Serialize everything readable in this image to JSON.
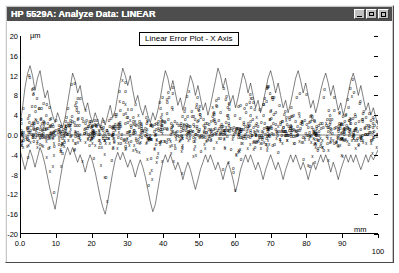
{
  "window": {
    "title": "HP 5529A: Analyze Data: LINEAR",
    "controls": [
      {
        "name": "minimize",
        "label": "_"
      },
      {
        "name": "maximize",
        "label": "□"
      },
      {
        "name": "close",
        "label": "×"
      }
    ]
  },
  "chart_data": {
    "type": "scatter",
    "title": "Linear Error Plot - X Axis",
    "xlabel": "mm",
    "ylabel": "µm",
    "xlim": [
      0,
      100
    ],
    "ylim": [
      -20,
      20
    ],
    "grid": false,
    "legend": "none",
    "xticks": [
      "0.0",
      "10",
      "20",
      "30",
      "40",
      "50",
      "60",
      "70",
      "80",
      "90",
      "100"
    ],
    "xtick_values": [
      0,
      10,
      20,
      30,
      40,
      50,
      60,
      70,
      80,
      90,
      100
    ],
    "yticks": [
      "20",
      "16",
      "12",
      "8",
      "4",
      "0.0",
      "-4",
      "-8",
      "-12",
      "-16",
      "-20"
    ],
    "ytick_values": [
      20,
      16,
      12,
      8,
      4,
      0,
      -4,
      -8,
      -12,
      -16,
      -20
    ],
    "x_unit": "mm",
    "y_unit": "µm",
    "series": [
      {
        "name": "forward-run",
        "marker": "o",
        "description": "Forward direction measurement points"
      },
      {
        "name": "reverse-run",
        "marker": "x",
        "description": "Reverse direction measurement points"
      },
      {
        "name": "upper-envelope",
        "marker": "line",
        "description": "Upper bound trace"
      },
      {
        "name": "lower-envelope",
        "marker": "line",
        "description": "Lower bound trace"
      }
    ],
    "upper_envelope": [
      [
        0.0,
        2.0
      ],
      [
        0.7,
        5.5
      ],
      [
        1.4,
        9.6
      ],
      [
        2.1,
        12.4
      ],
      [
        2.8,
        14.0
      ],
      [
        3.5,
        12.0
      ],
      [
        4.2,
        9.0
      ],
      [
        4.9,
        11.5
      ],
      [
        5.6,
        13.0
      ],
      [
        6.3,
        10.0
      ],
      [
        7.0,
        7.5
      ],
      [
        7.7,
        9.0
      ],
      [
        8.4,
        6.0
      ],
      [
        9.1,
        4.0
      ],
      [
        9.8,
        2.5
      ],
      [
        10.5,
        4.5
      ],
      [
        11.2,
        3.0
      ],
      [
        11.9,
        1.5
      ],
      [
        12.6,
        3.5
      ],
      [
        13.3,
        6.5
      ],
      [
        14.0,
        9.5
      ],
      [
        14.7,
        12.5
      ],
      [
        15.4,
        11.0
      ],
      [
        16.1,
        8.5
      ],
      [
        16.8,
        10.0
      ],
      [
        17.5,
        7.0
      ],
      [
        18.2,
        5.0
      ],
      [
        18.9,
        6.5
      ],
      [
        19.6,
        4.0
      ],
      [
        20.3,
        2.5
      ],
      [
        21.0,
        4.5
      ],
      [
        21.7,
        3.0
      ],
      [
        22.4,
        1.5
      ],
      [
        23.1,
        3.5
      ],
      [
        23.8,
        2.0
      ],
      [
        24.5,
        4.0
      ],
      [
        25.2,
        6.0
      ],
      [
        25.9,
        3.5
      ],
      [
        26.6,
        5.0
      ],
      [
        27.3,
        8.0
      ],
      [
        28.0,
        11.0
      ],
      [
        28.7,
        13.5
      ],
      [
        29.4,
        12.0
      ],
      [
        30.1,
        10.0
      ],
      [
        30.8,
        12.0
      ],
      [
        31.5,
        9.0
      ],
      [
        32.2,
        6.5
      ],
      [
        32.9,
        8.0
      ],
      [
        33.6,
        5.5
      ],
      [
        34.3,
        4.0
      ],
      [
        35.0,
        6.0
      ],
      [
        35.7,
        4.0
      ],
      [
        36.4,
        2.5
      ],
      [
        37.1,
        4.5
      ],
      [
        37.8,
        3.0
      ],
      [
        38.5,
        5.0
      ],
      [
        39.2,
        7.5
      ],
      [
        39.9,
        10.5
      ],
      [
        40.6,
        13.0
      ],
      [
        41.3,
        11.5
      ],
      [
        42.0,
        9.0
      ],
      [
        42.7,
        11.0
      ],
      [
        43.4,
        8.5
      ],
      [
        44.1,
        6.0
      ],
      [
        44.8,
        7.5
      ],
      [
        45.5,
        5.0
      ],
      [
        46.2,
        7.0
      ],
      [
        46.9,
        9.5
      ],
      [
        47.6,
        12.0
      ],
      [
        48.3,
        10.5
      ],
      [
        49.0,
        8.0
      ],
      [
        49.7,
        10.0
      ],
      [
        50.4,
        7.5
      ],
      [
        51.1,
        5.0
      ],
      [
        51.8,
        6.5
      ],
      [
        52.5,
        4.0
      ],
      [
        53.2,
        6.0
      ],
      [
        53.9,
        8.5
      ],
      [
        54.6,
        11.0
      ],
      [
        55.3,
        13.5
      ],
      [
        56.0,
        12.0
      ],
      [
        56.7,
        9.5
      ],
      [
        57.4,
        11.5
      ],
      [
        58.1,
        9.0
      ],
      [
        58.8,
        6.5
      ],
      [
        59.5,
        8.0
      ],
      [
        60.2,
        5.5
      ],
      [
        60.9,
        7.5
      ],
      [
        61.6,
        10.0
      ],
      [
        62.3,
        12.5
      ],
      [
        63.0,
        11.0
      ],
      [
        63.7,
        8.5
      ],
      [
        64.4,
        10.5
      ],
      [
        65.1,
        8.0
      ],
      [
        65.8,
        5.5
      ],
      [
        66.5,
        7.0
      ],
      [
        67.2,
        4.5
      ],
      [
        67.9,
        6.5
      ],
      [
        68.6,
        9.0
      ],
      [
        69.3,
        11.5
      ],
      [
        70.0,
        13.0
      ],
      [
        70.7,
        11.0
      ],
      [
        71.4,
        8.5
      ],
      [
        72.1,
        10.5
      ],
      [
        72.8,
        8.0
      ],
      [
        73.5,
        5.5
      ],
      [
        74.2,
        7.0
      ],
      [
        74.9,
        4.5
      ],
      [
        75.6,
        6.5
      ],
      [
        76.3,
        9.0
      ],
      [
        77.0,
        11.5
      ],
      [
        77.7,
        13.0
      ],
      [
        78.4,
        11.0
      ],
      [
        79.1,
        8.5
      ],
      [
        79.8,
        10.5
      ],
      [
        80.5,
        8.0
      ],
      [
        81.2,
        5.5
      ],
      [
        81.9,
        7.0
      ],
      [
        82.6,
        4.5
      ],
      [
        83.3,
        6.5
      ],
      [
        84.0,
        9.0
      ],
      [
        84.7,
        11.0
      ],
      [
        85.4,
        12.5
      ],
      [
        86.1,
        10.5
      ],
      [
        86.8,
        8.0
      ],
      [
        87.5,
        10.0
      ],
      [
        88.2,
        7.5
      ],
      [
        88.9,
        5.0
      ],
      [
        89.6,
        6.5
      ],
      [
        90.3,
        4.0
      ],
      [
        91.0,
        6.0
      ],
      [
        91.7,
        8.5
      ],
      [
        92.4,
        11.0
      ],
      [
        93.1,
        12.5
      ],
      [
        93.8,
        10.5
      ],
      [
        94.5,
        8.0
      ],
      [
        95.2,
        10.0
      ],
      [
        95.9,
        7.5
      ],
      [
        96.6,
        5.0
      ],
      [
        97.3,
        6.5
      ],
      [
        98.0,
        4.0
      ],
      [
        98.7,
        5.5
      ],
      [
        99.4,
        3.5
      ],
      [
        100.0,
        2.0
      ]
    ],
    "lower_envelope": [
      [
        0.0,
        -3.0
      ],
      [
        0.7,
        -5.0
      ],
      [
        1.4,
        -7.0
      ],
      [
        2.1,
        -5.0
      ],
      [
        2.8,
        -3.0
      ],
      [
        3.5,
        -4.5
      ],
      [
        4.2,
        -6.5
      ],
      [
        4.9,
        -4.5
      ],
      [
        5.6,
        -2.5
      ],
      [
        6.3,
        -4.0
      ],
      [
        7.0,
        -6.0
      ],
      [
        7.7,
        -8.5
      ],
      [
        8.4,
        -11.0
      ],
      [
        9.1,
        -13.0
      ],
      [
        9.8,
        -15.0
      ],
      [
        10.5,
        -12.0
      ],
      [
        11.2,
        -9.0
      ],
      [
        11.9,
        -6.0
      ],
      [
        12.6,
        -4.0
      ],
      [
        13.3,
        -2.5
      ],
      [
        14.0,
        -4.0
      ],
      [
        14.7,
        -2.5
      ],
      [
        15.4,
        -4.0
      ],
      [
        16.1,
        -5.5
      ],
      [
        16.8,
        -4.0
      ],
      [
        17.5,
        -5.5
      ],
      [
        18.2,
        -7.5
      ],
      [
        18.9,
        -5.5
      ],
      [
        19.6,
        -4.0
      ],
      [
        20.3,
        -5.5
      ],
      [
        21.0,
        -7.5
      ],
      [
        21.7,
        -10.0
      ],
      [
        22.4,
        -12.5
      ],
      [
        23.1,
        -14.5
      ],
      [
        23.8,
        -16.0
      ],
      [
        24.5,
        -13.5
      ],
      [
        25.2,
        -10.5
      ],
      [
        25.9,
        -7.5
      ],
      [
        26.6,
        -5.0
      ],
      [
        27.3,
        -3.5
      ],
      [
        28.0,
        -5.0
      ],
      [
        28.7,
        -3.5
      ],
      [
        29.4,
        -5.0
      ],
      [
        30.1,
        -6.5
      ],
      [
        30.8,
        -5.0
      ],
      [
        31.5,
        -6.5
      ],
      [
        32.2,
        -8.5
      ],
      [
        32.9,
        -6.5
      ],
      [
        33.6,
        -5.0
      ],
      [
        34.3,
        -6.5
      ],
      [
        35.0,
        -8.5
      ],
      [
        35.7,
        -11.0
      ],
      [
        36.4,
        -13.5
      ],
      [
        37.1,
        -15.5
      ],
      [
        37.8,
        -14.0
      ],
      [
        38.5,
        -11.0
      ],
      [
        39.2,
        -8.0
      ],
      [
        39.9,
        -5.5
      ],
      [
        40.6,
        -4.0
      ],
      [
        41.3,
        -5.5
      ],
      [
        42.0,
        -4.0
      ],
      [
        42.7,
        -5.5
      ],
      [
        43.4,
        -7.0
      ],
      [
        44.1,
        -5.5
      ],
      [
        44.8,
        -7.0
      ],
      [
        45.5,
        -9.0
      ],
      [
        46.2,
        -7.0
      ],
      [
        46.9,
        -5.5
      ],
      [
        47.6,
        -7.0
      ],
      [
        48.3,
        -9.0
      ],
      [
        49.0,
        -11.0
      ],
      [
        49.7,
        -9.0
      ],
      [
        50.4,
        -7.0
      ],
      [
        51.1,
        -5.5
      ],
      [
        51.8,
        -4.0
      ],
      [
        52.5,
        -5.5
      ],
      [
        53.2,
        -4.0
      ],
      [
        53.9,
        -5.5
      ],
      [
        54.6,
        -7.0
      ],
      [
        55.3,
        -5.5
      ],
      [
        56.0,
        -7.0
      ],
      [
        56.7,
        -9.0
      ],
      [
        57.4,
        -7.0
      ],
      [
        58.1,
        -5.5
      ],
      [
        58.8,
        -7.0
      ],
      [
        59.5,
        -9.0
      ],
      [
        60.2,
        -11.5
      ],
      [
        60.9,
        -9.5
      ],
      [
        61.6,
        -7.0
      ],
      [
        62.3,
        -5.5
      ],
      [
        63.0,
        -4.0
      ],
      [
        63.7,
        -5.5
      ],
      [
        64.4,
        -4.0
      ],
      [
        65.1,
        -5.5
      ],
      [
        65.8,
        -7.0
      ],
      [
        66.5,
        -5.5
      ],
      [
        67.2,
        -7.0
      ],
      [
        67.9,
        -9.0
      ],
      [
        68.6,
        -7.0
      ],
      [
        69.3,
        -5.5
      ],
      [
        70.0,
        -4.0
      ],
      [
        70.7,
        -5.5
      ],
      [
        71.4,
        -7.0
      ],
      [
        72.1,
        -5.5
      ],
      [
        72.8,
        -7.0
      ],
      [
        73.5,
        -9.0
      ],
      [
        74.2,
        -7.0
      ],
      [
        74.9,
        -5.5
      ],
      [
        75.6,
        -4.0
      ],
      [
        76.3,
        -5.5
      ],
      [
        77.0,
        -4.0
      ],
      [
        77.7,
        -5.5
      ],
      [
        78.4,
        -7.0
      ],
      [
        79.1,
        -5.5
      ],
      [
        79.8,
        -7.0
      ],
      [
        80.5,
        -9.0
      ],
      [
        81.2,
        -7.0
      ],
      [
        81.9,
        -5.5
      ],
      [
        82.6,
        -7.0
      ],
      [
        83.3,
        -5.5
      ],
      [
        84.0,
        -4.0
      ],
      [
        84.7,
        -5.5
      ],
      [
        85.4,
        -4.0
      ],
      [
        86.1,
        -5.5
      ],
      [
        86.8,
        -7.5
      ],
      [
        87.5,
        -5.5
      ],
      [
        88.2,
        -7.0
      ],
      [
        88.9,
        -9.0
      ],
      [
        89.6,
        -7.0
      ],
      [
        90.3,
        -5.5
      ],
      [
        91.0,
        -4.0
      ],
      [
        91.7,
        -5.5
      ],
      [
        92.4,
        -4.0
      ],
      [
        93.1,
        -5.5
      ],
      [
        93.8,
        -4.0
      ],
      [
        94.5,
        -5.5
      ],
      [
        95.2,
        -7.0
      ],
      [
        95.9,
        -5.5
      ],
      [
        96.6,
        -4.0
      ],
      [
        97.3,
        -5.5
      ],
      [
        98.0,
        -4.0
      ],
      [
        98.7,
        -5.0
      ],
      [
        99.4,
        -4.0
      ],
      [
        100.0,
        -3.0
      ]
    ]
  }
}
